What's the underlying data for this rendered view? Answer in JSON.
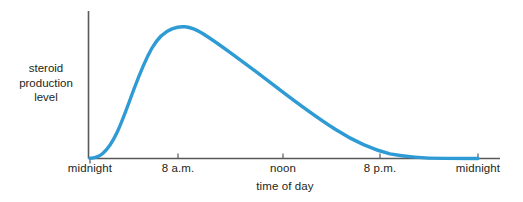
{
  "chart_data": {
    "type": "line",
    "title": "",
    "subtitle": "",
    "xlabel": "time of day",
    "ylabel": "steroid production level",
    "ylabel_lines": [
      "steroid",
      "production",
      "level"
    ],
    "grid": false,
    "legend": false,
    "legend_position": "none",
    "axis_color": "#58595b",
    "series_color": "#2e9bd4",
    "series_width_px": 3.4,
    "xlim": [
      0,
      24
    ],
    "ylim": [
      0,
      1.05
    ],
    "x_tick_values": [
      0,
      8,
      12,
      20,
      24
    ],
    "x_tick_labels": [
      "midnight",
      "8 a.m.",
      "noon",
      "8 p.m.",
      "midnight"
    ],
    "y_tick_labels": [],
    "series": [
      {
        "name": "steroid production level",
        "x": [
          0,
          1,
          2,
          3,
          4,
          5,
          6,
          7,
          8,
          9,
          10,
          11,
          12,
          13,
          14,
          15,
          16,
          17,
          18,
          19,
          20,
          21,
          22,
          23,
          24
        ],
        "y": [
          0.0,
          0.01,
          0.04,
          0.12,
          0.27,
          0.47,
          0.68,
          0.85,
          0.95,
          0.99,
          0.97,
          0.92,
          0.86,
          0.79,
          0.72,
          0.64,
          0.56,
          0.48,
          0.4,
          0.31,
          0.23,
          0.15,
          0.08,
          0.03,
          0.0
        ]
      }
    ],
    "annotations": [
      {
        "text": "peak near 8-9 a.m.",
        "x": 8.6,
        "y": 1.0,
        "visible": false
      }
    ],
    "path_d": "M 90,158.2 C 95,158 99,156.6 103,153.2 C 108.5,148.5 113,141 117.5,131.5 C 123,119.5 128,105 134,89 C 140,73 146,58.5 152,48 C 158,37.5 165,31.5 172,28.8 C 177,26.9 181,26.4 185,26.8 C 191,27.4 197,30 203,33.8 C 212,39.4 222,46.6 233,54.6 C 247,64.8 262,76 277,87.6 C 296,102.2 316,117 336,129.8 C 354,141.2 372,149.6 390,153.8 C 408,157.2 426,158.2 444,158.4 C 458,158.5 468,158.5 478,158.5",
    "axis_geometry": {
      "origin_x": 88.5,
      "origin_y": 158.5,
      "y_axis_top": 11,
      "x_axis_right": 500,
      "tick_length": 5,
      "tick_x_positions": [
        90,
        178,
        283,
        380,
        478
      ]
    }
  },
  "labels": {
    "ylabel_line_1": "steroid",
    "ylabel_line_2": "production",
    "ylabel_line_3": "level",
    "xlabel": "time of day",
    "tick_0": "midnight",
    "tick_1": "8 a.m.",
    "tick_2": "noon",
    "tick_3": "8 p.m.",
    "tick_4": "midnight"
  }
}
